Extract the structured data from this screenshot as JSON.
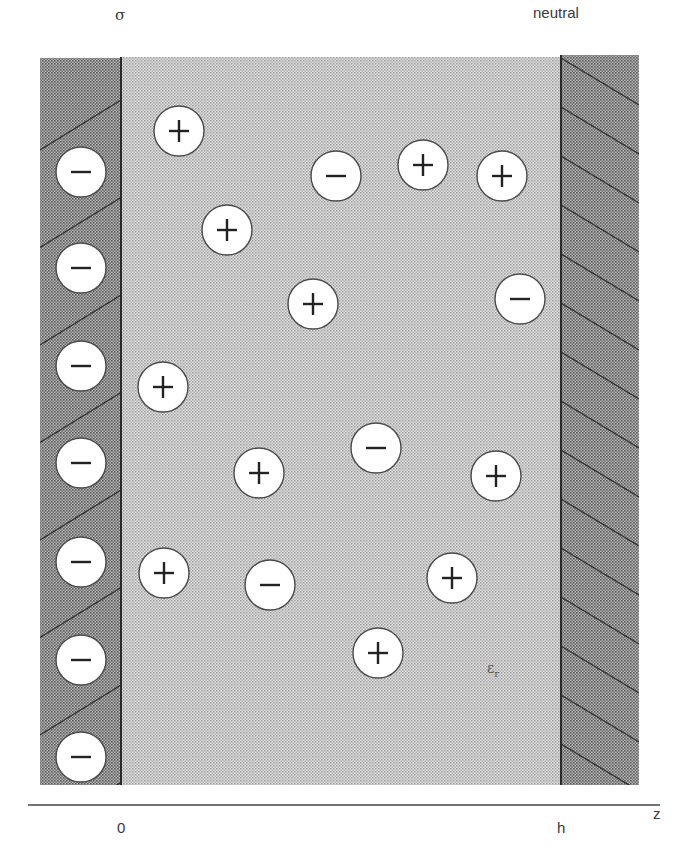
{
  "figure": {
    "labels": {
      "left_wall": "σ",
      "right_wall": "neutral",
      "axis_origin": "0",
      "axis_end": "h",
      "axis_name": "z",
      "permittivity": "ε",
      "permittivity_sub": "r"
    },
    "colors": {
      "wall_fill": "#8c8c8c",
      "fluid_fill": "#c9c9c9",
      "ion_fill": "#ffffff",
      "ion_stroke": "#4a4a4a",
      "line": "#2f2f2f"
    },
    "surface_charges": [
      {
        "sign": "−",
        "x": 81,
        "y": 172
      },
      {
        "sign": "−",
        "x": 81,
        "y": 268
      },
      {
        "sign": "−",
        "x": 81,
        "y": 366
      },
      {
        "sign": "−",
        "x": 81,
        "y": 463
      },
      {
        "sign": "−",
        "x": 81,
        "y": 562
      },
      {
        "sign": "−",
        "x": 81,
        "y": 660
      },
      {
        "sign": "−",
        "x": 81,
        "y": 757
      }
    ],
    "ions": [
      {
        "sign": "+",
        "x": 179,
        "y": 131
      },
      {
        "sign": "−",
        "x": 336,
        "y": 176
      },
      {
        "sign": "+",
        "x": 423,
        "y": 165
      },
      {
        "sign": "+",
        "x": 502,
        "y": 176
      },
      {
        "sign": "+",
        "x": 227,
        "y": 230
      },
      {
        "sign": "+",
        "x": 313,
        "y": 304
      },
      {
        "sign": "−",
        "x": 520,
        "y": 299
      },
      {
        "sign": "+",
        "x": 163,
        "y": 387
      },
      {
        "sign": "−",
        "x": 376,
        "y": 448
      },
      {
        "sign": "+",
        "x": 259,
        "y": 473
      },
      {
        "sign": "+",
        "x": 496,
        "y": 476
      },
      {
        "sign": "+",
        "x": 164,
        "y": 573
      },
      {
        "sign": "−",
        "x": 270,
        "y": 585
      },
      {
        "sign": "+",
        "x": 452,
        "y": 578
      },
      {
        "sign": "+",
        "x": 378,
        "y": 653
      }
    ]
  }
}
